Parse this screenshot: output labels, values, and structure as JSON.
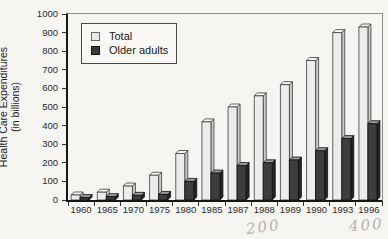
{
  "figure": {
    "y_axis_title_line1": "Health Care Expenditures",
    "y_axis_title_line2": "(in billions)",
    "handwritten_notes": [
      {
        "text": "200"
      },
      {
        "text": "400"
      }
    ]
  },
  "chart_data": {
    "type": "bar",
    "title": "",
    "xlabel": "",
    "ylabel": "Health Care Expenditures (in billions)",
    "ylim": [
      0,
      1000
    ],
    "yticks": [
      0,
      100,
      200,
      300,
      400,
      500,
      600,
      700,
      800,
      900,
      1000
    ],
    "grid": false,
    "legend_position": "upper-left",
    "categories": [
      "1960",
      "1965",
      "1970",
      "1975",
      "1980",
      "1985",
      "1987",
      "1988",
      "1989",
      "1990",
      "1993",
      "1996"
    ],
    "series": [
      {
        "name": "Total",
        "values": [
          27,
          42,
          75,
          133,
          250,
          420,
          500,
          560,
          620,
          750,
          900,
          930
        ],
        "front": "#ececec",
        "top": "#f8f8f8",
        "side": "#cbcbcb",
        "stroke": "#3c3c3c"
      },
      {
        "name": "Older adults",
        "values": [
          13,
          18,
          25,
          30,
          100,
          145,
          185,
          200,
          215,
          265,
          330,
          410
        ],
        "front": "#3d3d3d",
        "top": "#9c9c9c",
        "side": "#232323",
        "stroke": "#101010"
      }
    ]
  }
}
